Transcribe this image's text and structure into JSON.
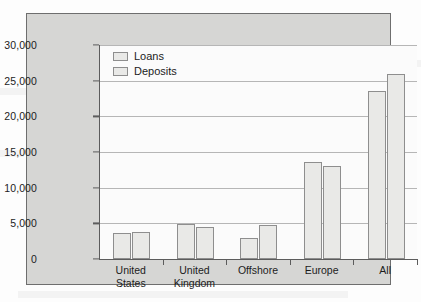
{
  "chart_data": {
    "type": "bar",
    "title": "",
    "xlabel": "",
    "ylabel": "",
    "ylim": [
      0,
      30000
    ],
    "yticks": [
      0,
      5000,
      10000,
      15000,
      20000,
      25000,
      30000
    ],
    "ytick_labels": [
      "0",
      "5,000",
      "10,000",
      "15,000",
      "20,000",
      "25,000",
      "30,000"
    ],
    "grid": true,
    "legend_position": "top-left",
    "categories": [
      "United States",
      "United Kingdom",
      "Offshore",
      "Europe",
      "All"
    ],
    "category_lines": [
      [
        "United",
        "States"
      ],
      [
        "United",
        "Kingdom"
      ],
      [
        "Offshore"
      ],
      [
        "Europe"
      ],
      [
        "All"
      ]
    ],
    "series": [
      {
        "name": "Loans",
        "values": [
          3700,
          4900,
          3000,
          13600,
          23500
        ]
      },
      {
        "name": "Deposits",
        "values": [
          3850,
          4500,
          4750,
          13100,
          26000
        ]
      }
    ]
  },
  "style": {
    "panel_background": "#d6d6d4",
    "panel_border": "#6e6e6e",
    "plot_background": "#fbfbfb",
    "bar_fill": "#e9e9e7",
    "bar_border": "#8e8e8e",
    "gridline_color": "#b6b6b6",
    "axis_color": "#5c5c5c",
    "text_color": "#1c1c1c"
  }
}
